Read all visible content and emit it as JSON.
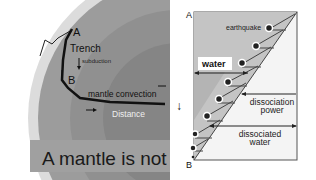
{
  "left_diagram": {
    "labels": {
      "point_a": "A",
      "point_b": "B",
      "trench": "Trench",
      "subduction": "subduction",
      "mantle_convection": "mantle convection",
      "distance": "Distance"
    },
    "caption": "A mantle is not a",
    "colors": {
      "outer_ring": "#dcdcdc",
      "mantle": "#9a9a9a",
      "inner_core": "#8a8a8a",
      "path": "#111111"
    }
  },
  "right_diagram": {
    "labels": {
      "point_a": "A",
      "point_b": "B",
      "earthquake": "earthquake",
      "water": "water",
      "dissociation_power_line1": "dissociation",
      "dissociation_power_line2": "power",
      "dissociated_water_line1": "dissociated",
      "dissociated_water_line2": "water",
      "depth_arrow": "↓"
    },
    "colors": {
      "wedge": "#c4c4c4",
      "background": "#f4f4f4",
      "dot": "#222222",
      "border": "#555555"
    },
    "earthquake_count": 8
  }
}
